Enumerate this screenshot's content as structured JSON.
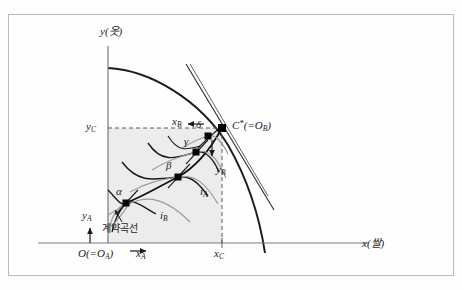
{
  "figure": {
    "type": "edgeworth-box-in-ppf",
    "title_fragment_top": "",
    "axes": {
      "y_axis_label": "y(옷)",
      "x_axis_label": "x(쌀)",
      "origin_label": "O(=O",
      "origin_sub": "A",
      "origin_close": ")"
    },
    "tick_labels": {
      "y_c": "y",
      "y_c_sub": "C",
      "x_c": "x",
      "x_c_sub": "C"
    },
    "box": {
      "x_a_label": "x",
      "x_a_sub": "A",
      "y_a_label": "y",
      "y_a_sub": "A",
      "x_b_label": "x",
      "x_b_sub": "B",
      "y_b_label": "y",
      "y_b_sub": "B",
      "arrow_x_a": "→",
      "arrow_y_a": "↑",
      "arrow_x_b": "←",
      "arrow_y_b": "↓"
    },
    "points": {
      "alpha": "α",
      "beta": "β",
      "gamma": "γ",
      "delta": "δ",
      "c_star": "C",
      "c_star_star": "*",
      "c_star_eq": "(=O",
      "c_star_sub": "B",
      "c_star_close": ")"
    },
    "curve_labels": {
      "i_a": "i",
      "i_a_sub": "A",
      "i_b": "i",
      "i_b_sub": "B",
      "contract_curve": "계약곡선"
    },
    "colors": {
      "frame_border": "#b9b9b9",
      "axis": "#6f6f6f",
      "ppf_curve": "#1a1a1a",
      "box_fill": "#eeeeee",
      "dashed": "#5a5a5a",
      "contract_curve": "#111111",
      "indifference_a": "#1a1a1a",
      "indifference_b": "#9a9a9a",
      "tangent": "#2a2a2a",
      "point_marker": "#000000"
    }
  }
}
